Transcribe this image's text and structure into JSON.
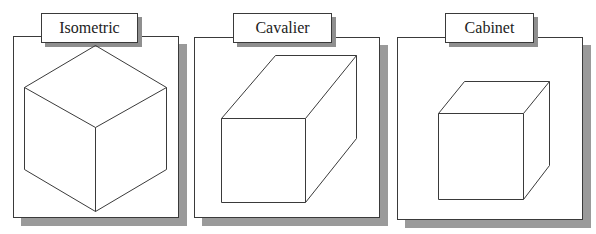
{
  "diagram": {
    "line_color": "#3a3a3a",
    "shadow_color": "#9a9a9a",
    "panels": [
      {
        "label": "Isometric",
        "frame": {
          "x": 13,
          "y": 36,
          "w": 166,
          "h": 182
        },
        "label_box": {
          "x": 41,
          "y": 13,
          "w": 97,
          "h": 30
        },
        "cube": {
          "polylines": [
            [
              [
                95,
                45
              ],
              [
                166,
                87
              ],
              [
                166,
                169
              ],
              [
                95,
                211
              ],
              [
                24,
                169
              ],
              [
                24,
                87
              ],
              [
                95,
                45
              ]
            ],
            [
              [
                24,
                87
              ],
              [
                95,
                127
              ],
              [
                166,
                87
              ]
            ],
            [
              [
                95,
                127
              ],
              [
                95,
                211
              ]
            ]
          ]
        }
      },
      {
        "label": "Cavalier",
        "frame": {
          "x": 194,
          "y": 37,
          "w": 186,
          "h": 181
        },
        "label_box": {
          "x": 233,
          "y": 13,
          "w": 99,
          "h": 30
        },
        "cube": {
          "polylines": [
            [
              [
                221,
                118
              ],
              [
                305,
                118
              ],
              [
                305,
                202
              ],
              [
                221,
                202
              ],
              [
                221,
                118
              ]
            ],
            [
              [
                221,
                118
              ],
              [
                275,
                55
              ],
              [
                356,
                55
              ],
              [
                305,
                118
              ]
            ],
            [
              [
                356,
                55
              ],
              [
                356,
                138
              ],
              [
                305,
                202
              ]
            ]
          ]
        }
      },
      {
        "label": "Cabinet",
        "frame": {
          "x": 397,
          "y": 37,
          "w": 186,
          "h": 183
        },
        "label_box": {
          "x": 445,
          "y": 13,
          "w": 89,
          "h": 30
        },
        "cube": {
          "polylines": [
            [
              [
                438,
                113
              ],
              [
                523,
                113
              ],
              [
                523,
                199
              ],
              [
                438,
                199
              ],
              [
                438,
                113
              ]
            ],
            [
              [
                438,
                113
              ],
              [
                464,
                81
              ],
              [
                549,
                81
              ],
              [
                523,
                113
              ]
            ],
            [
              [
                549,
                81
              ],
              [
                549,
                165
              ],
              [
                523,
                199
              ]
            ]
          ]
        }
      }
    ]
  }
}
